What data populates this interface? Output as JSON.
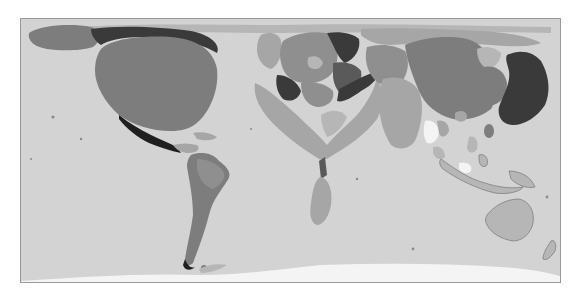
{
  "map": {
    "type": "cartogram",
    "projection": "world, equirectangular-like, distorted by variable",
    "title": "",
    "color_scheme": "grayscale",
    "colors": {
      "ocean": "#d3d3d3",
      "antarctica": "#f4f4f4",
      "darkest": "#1f1f1f",
      "dark": "#3a3a3a",
      "mid_dark": "#5a5a5a",
      "mid": "#7d7d7d",
      "mid_light": "#8f8f8f",
      "light": "#a6a6a6",
      "lighter": "#b6b6b6",
      "frame": "#9a9a9a"
    },
    "regions": [
      {
        "name": "Alaska",
        "shade": "mid"
      },
      {
        "name": "Canada",
        "shade": "dark"
      },
      {
        "name": "United States",
        "shade": "mid"
      },
      {
        "name": "Mexico",
        "shade": "darkest"
      },
      {
        "name": "Central America & Caribbean",
        "shade": "light"
      },
      {
        "name": "South America",
        "shade": "mid"
      },
      {
        "name": "Europe",
        "shade": "mixed"
      },
      {
        "name": "Africa",
        "shade": "light"
      },
      {
        "name": "Middle East",
        "shade": "mid_dark"
      },
      {
        "name": "Russia / Northern Asia",
        "shade": "light"
      },
      {
        "name": "South Asia (India)",
        "shade": "mid"
      },
      {
        "name": "China",
        "shade": "mid"
      },
      {
        "name": "Korea",
        "shade": "mid"
      },
      {
        "name": "Japan",
        "shade": "dark"
      },
      {
        "name": "Southeast Asia",
        "shade": "mixed"
      },
      {
        "name": "Indonesia",
        "shade": "light"
      },
      {
        "name": "Australia",
        "shade": "lighter"
      },
      {
        "name": "New Zealand",
        "shade": "lighter"
      },
      {
        "name": "Antarctica",
        "shade": "antarctica"
      }
    ]
  }
}
